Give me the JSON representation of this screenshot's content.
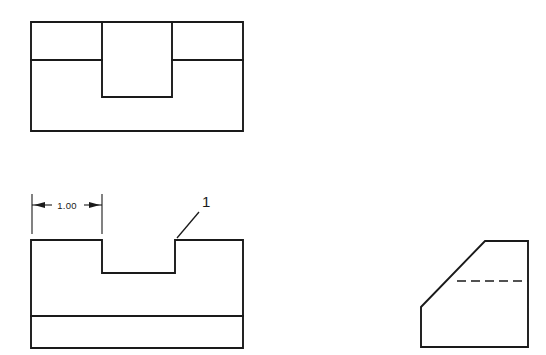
{
  "sheet": {
    "background_color": "#ffffff",
    "line_color": "#1a1a1a",
    "width": 546,
    "height": 355
  },
  "views": {
    "top_view": {
      "name": "Top View",
      "outline": {
        "x1": 31,
        "y1": 22,
        "x2": 243,
        "y2": 131
      },
      "horizontal_edge_y": 60,
      "slot": {
        "x1": 102,
        "x2": 172,
        "y_bottom": 97
      }
    },
    "front_view": {
      "name": "Front View",
      "outline": {
        "x1": 31,
        "y1": 240,
        "x2": 243,
        "y2": 348
      },
      "horizontal_edge_y": 316,
      "notch": {
        "x1": 102,
        "x2": 175,
        "y_bottom": 273
      }
    },
    "right_side_view": {
      "name": "Right Side View",
      "outline": {
        "x1": 421,
        "y1": 241,
        "x2": 528,
        "y2": 347
      },
      "chamfer": {
        "from_x": 421,
        "from_y": 307,
        "to_x": 485,
        "to_y": 241
      },
      "hidden_line_y": 281,
      "hidden_line_x1": 457,
      "hidden_line_x2": 528
    }
  },
  "annotations": {
    "dimension": {
      "label": "1.00",
      "value": 1.0,
      "units": "inches",
      "arrow_style": "outward",
      "dimension_line_y": 205,
      "extension_left_x": 32,
      "extension_right_x": 102,
      "extension_top_y": 194,
      "extension_bottom_y": 234,
      "text_x": 67,
      "text_y": 209
    },
    "balloon": {
      "label": "1",
      "text_x": 203,
      "text_y": 206,
      "leader_start_x": 177,
      "leader_start_y": 238,
      "leader_end_x": 199,
      "leader_end_y": 212
    }
  }
}
